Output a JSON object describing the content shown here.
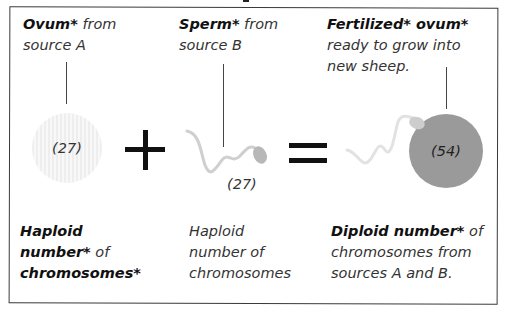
{
  "diagram": {
    "ovum_block": {
      "title_bold": "Ovum*",
      "title_rest": " from",
      "line2": "source A",
      "chromosome_count": "(27)"
    },
    "operator_plus": "+",
    "sperm_block": {
      "title_bold": "Sperm*",
      "title_rest": " from",
      "line2": "source B",
      "chromosome_count": "(27)"
    },
    "operator_equals": "=",
    "fertilized_block": {
      "title_bold": "Fertilized* ovum*",
      "line2": "ready to grow into",
      "line3": "new sheep.",
      "chromosome_count": "(54)"
    },
    "captions": {
      "haploid_left": {
        "line1_bold": "Haploid",
        "line2_bold": "number*",
        "line2_rest": " of",
        "line3_bold": "chromosomes*"
      },
      "haploid_middle": {
        "line1": "Haploid",
        "line2": "number of",
        "line3": "chromosomes"
      },
      "diploid_right": {
        "line1_bold": "Diploid number*",
        "line1_rest": " of",
        "line2": "chromosomes from",
        "line3": "sources A and B."
      }
    },
    "colors": {
      "ovum_fill": "#f1f1f1",
      "fertilized_fill": "#9a9a9a",
      "sperm_tail": "#cfcfcf",
      "sperm_head": "#b8b8b8",
      "border": "#3a3a3a"
    }
  }
}
